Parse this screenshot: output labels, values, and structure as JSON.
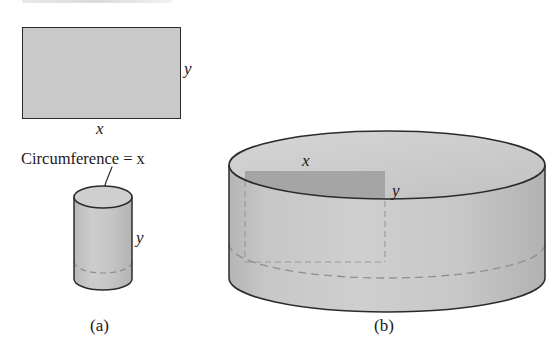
{
  "figure": {
    "caption_a": "(a)",
    "caption_b": "(b)",
    "colors": {
      "fill_light": "#c9c9c9",
      "fill_cylinder": "#c6c6c6",
      "fill_top_disk": "#cfcfcf",
      "fill_inner_patch": "#a8a8a8",
      "stroke": "#2b2b2b",
      "stroke_dashed": "#8a8a8a",
      "background": "#ffffff"
    }
  },
  "panel_a": {
    "rectangle": {
      "name": "unrolled-lateral-surface",
      "width_label": "x",
      "height_label": "y"
    },
    "annotation": "Circumference = x",
    "cylinder": {
      "name": "tall-narrow-cylinder",
      "height_label": "y"
    },
    "caption": "(a)"
  },
  "panel_b": {
    "cylinder": {
      "name": "short-wide-cylinder",
      "arc_label": "x",
      "height_label": "y"
    },
    "caption": "(b)"
  }
}
